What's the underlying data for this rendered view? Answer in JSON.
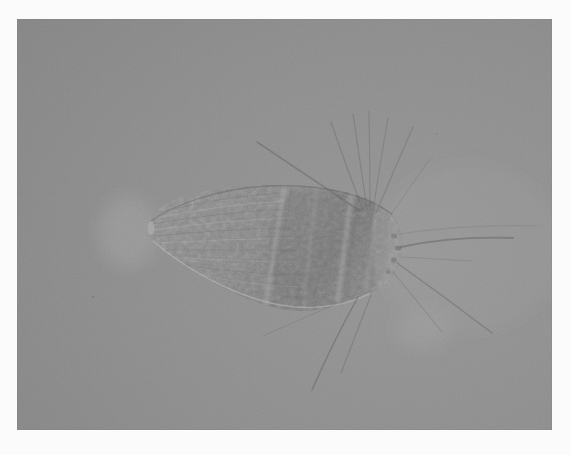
{
  "figure": {
    "type": "photomicrograph",
    "photo": {
      "x": 17,
      "y": 19,
      "width": 535,
      "height": 411
    },
    "palette": {
      "border": "#fbfbfb",
      "bg_light": "#969696",
      "bg_mid": "#8e8e8e",
      "bg_dark": "#858585",
      "body_a": "#8b8b8b",
      "body_b": "#808080",
      "body_c": "#737373",
      "body_d": "#828282",
      "dark": "#5c5c5c",
      "light": "#c2c2c2",
      "seta": "#636363",
      "white_glow": "#d9d9d9",
      "frame_edge": "#7f7f7f"
    },
    "organism": {
      "body_outline": "M148,226 C149,215 160,205 178,198 C205,189 238,185 270,185 C305,185 342,188 368,199 C385,206 397,217 400,229 C403,240 403,253 399,264 C395,277 386,286 370,293 C349,303 322,312 299,311 C271,310 238,297 209,280 C184,266 158,248 151,239 C148,234 147,231 148,226 Z",
      "striations": [
        {
          "d": "M160,212 Q220,197 280,193",
          "tone": "dark",
          "w": 1,
          "o": 0.22
        },
        {
          "d": "M155,218 Q220,205 284,201",
          "tone": "light",
          "w": 1,
          "o": 0.28
        },
        {
          "d": "M153,224 Q222,212 288,209",
          "tone": "dark",
          "w": 1,
          "o": 0.22
        },
        {
          "d": "M153,230 Q224,220 290,218",
          "tone": "light",
          "w": 1,
          "o": 0.28
        },
        {
          "d": "M155,236 Q226,229 292,228",
          "tone": "dark",
          "w": 1,
          "o": 0.22
        },
        {
          "d": "M159,243 Q228,239 294,238",
          "tone": "light",
          "w": 1,
          "o": 0.26
        },
        {
          "d": "M166,250 Q232,250 296,250",
          "tone": "dark",
          "w": 1,
          "o": 0.2
        },
        {
          "d": "M174,257 Q238,262 298,262",
          "tone": "light",
          "w": 1,
          "o": 0.24
        },
        {
          "d": "M184,265 Q244,274 300,275",
          "tone": "dark",
          "w": 1,
          "o": 0.18
        },
        {
          "d": "M196,274 Q252,286 302,287",
          "tone": "light",
          "w": 1,
          "o": 0.2
        }
      ],
      "patches": [
        {
          "d": "M292,193 C270,210 262,250 272,282 C282,306 310,310 336,306 C360,302 378,290 386,270 C392,252 390,224 380,210 C366,196 320,188 292,193 Z",
          "tone": "dark",
          "o": 0.17
        },
        {
          "d": "M378,205 C392,212 400,222 401,235 C403,252 400,264 394,274 C389,282 383,287 377,289 C372,262 373,231 378,205 Z",
          "tone": "light",
          "o": 0.2
        }
      ],
      "bands": [
        {
          "d": "M284,189 Q274,248 266,305",
          "tone": "light",
          "w": 4,
          "o": 0.3
        },
        {
          "d": "M291,189 Q281,248 273,305",
          "tone": "dark",
          "w": 1.4,
          "o": 0.25
        },
        {
          "d": "M317,188 Q309,250 304,308",
          "tone": "light",
          "w": 3,
          "o": 0.18
        },
        {
          "d": "M352,192 Q344,248 338,300",
          "tone": "light",
          "w": 5,
          "o": 0.3
        },
        {
          "d": "M359,194 Q351,248 345,298",
          "tone": "dark",
          "w": 1.4,
          "o": 0.25
        },
        {
          "d": "M377,202 Q371,248 366,291",
          "tone": "light",
          "w": 3,
          "o": 0.22
        }
      ],
      "edges": [
        {
          "d": "M151,221 C172,206 214,189 268,186 C318,184 362,193 392,214",
          "tone": "dark",
          "w": 1.3,
          "o": 0.45
        },
        {
          "d": "M153,241 C178,263 216,286 256,299 C294,311 334,311 369,294",
          "tone": "light",
          "w": 1.5,
          "o": 0.5
        }
      ],
      "setae": [
        {
          "d": "M360,211 Q308,176 257,142",
          "w": 1.6,
          "o": 0.5
        },
        {
          "d": "M363,210 Q346,166 331,122",
          "w": 1.2,
          "o": 0.42
        },
        {
          "d": "M367,209 Q360,161 353,114",
          "w": 1.2,
          "o": 0.42
        },
        {
          "d": "M370,210 Q370,160 369,111",
          "w": 1.1,
          "o": 0.38
        },
        {
          "d": "M373,211 Q380,164 388,118",
          "w": 1.1,
          "o": 0.38
        },
        {
          "d": "M376,213 Q394,170 413,127",
          "w": 1.2,
          "o": 0.4
        },
        {
          "d": "M387,220 Q408,190 430,159",
          "w": 1,
          "o": 0.28
        },
        {
          "d": "M399,234 Q468,224 537,226",
          "w": 1.1,
          "o": 0.22
        },
        {
          "d": "M401,247 Q452,236 513,238",
          "w": 1.8,
          "o": 0.55
        },
        {
          "d": "M402,257 Q438,259 472,261",
          "w": 1,
          "o": 0.28
        },
        {
          "d": "M397,263 Q445,297 492,333",
          "w": 1.4,
          "o": 0.5
        },
        {
          "d": "M393,272 Q417,301 442,332",
          "w": 1.1,
          "o": 0.33
        },
        {
          "d": "M358,297 Q333,342 312,390",
          "w": 1.5,
          "o": 0.55
        },
        {
          "d": "M371,295 Q356,334 341,373",
          "w": 1.2,
          "o": 0.4
        },
        {
          "d": "M338,303 Q300,320 263,336",
          "w": 1,
          "o": 0.28
        }
      ],
      "nubs": [
        {
          "cx": 394,
          "cy": 236,
          "rx": 3,
          "ry": 2.5,
          "tone": "dark",
          "o": 0.4
        },
        {
          "cx": 398,
          "cy": 248,
          "rx": 3.2,
          "ry": 2.6,
          "tone": "dark",
          "o": 0.45
        },
        {
          "cx": 394,
          "cy": 260,
          "rx": 3,
          "ry": 2.5,
          "tone": "dark",
          "o": 0.4
        },
        {
          "cx": 388,
          "cy": 272,
          "rx": 2.6,
          "ry": 2.2,
          "tone": "dark",
          "o": 0.35
        },
        {
          "cx": 151,
          "cy": 228,
          "rx": 3.5,
          "ry": 7,
          "tone": "light",
          "o": 0.45
        }
      ]
    },
    "background": {
      "glows": [
        {
          "cx": 128,
          "cy": 232,
          "rx": 30,
          "ry": 36,
          "tone": "white_glow",
          "o": 0.14
        },
        {
          "cx": 422,
          "cy": 330,
          "rx": 28,
          "ry": 20,
          "tone": "white_glow",
          "o": 0.1
        },
        {
          "cx": 468,
          "cy": 248,
          "rx": 95,
          "ry": 85,
          "tone": "white_glow",
          "o": 0.05
        }
      ],
      "specks": [
        {
          "cx": 93,
          "cy": 297,
          "r": 1.3,
          "o": 0.35
        },
        {
          "cx": 437,
          "cy": 134,
          "r": 1,
          "o": 0.22
        }
      ]
    }
  }
}
